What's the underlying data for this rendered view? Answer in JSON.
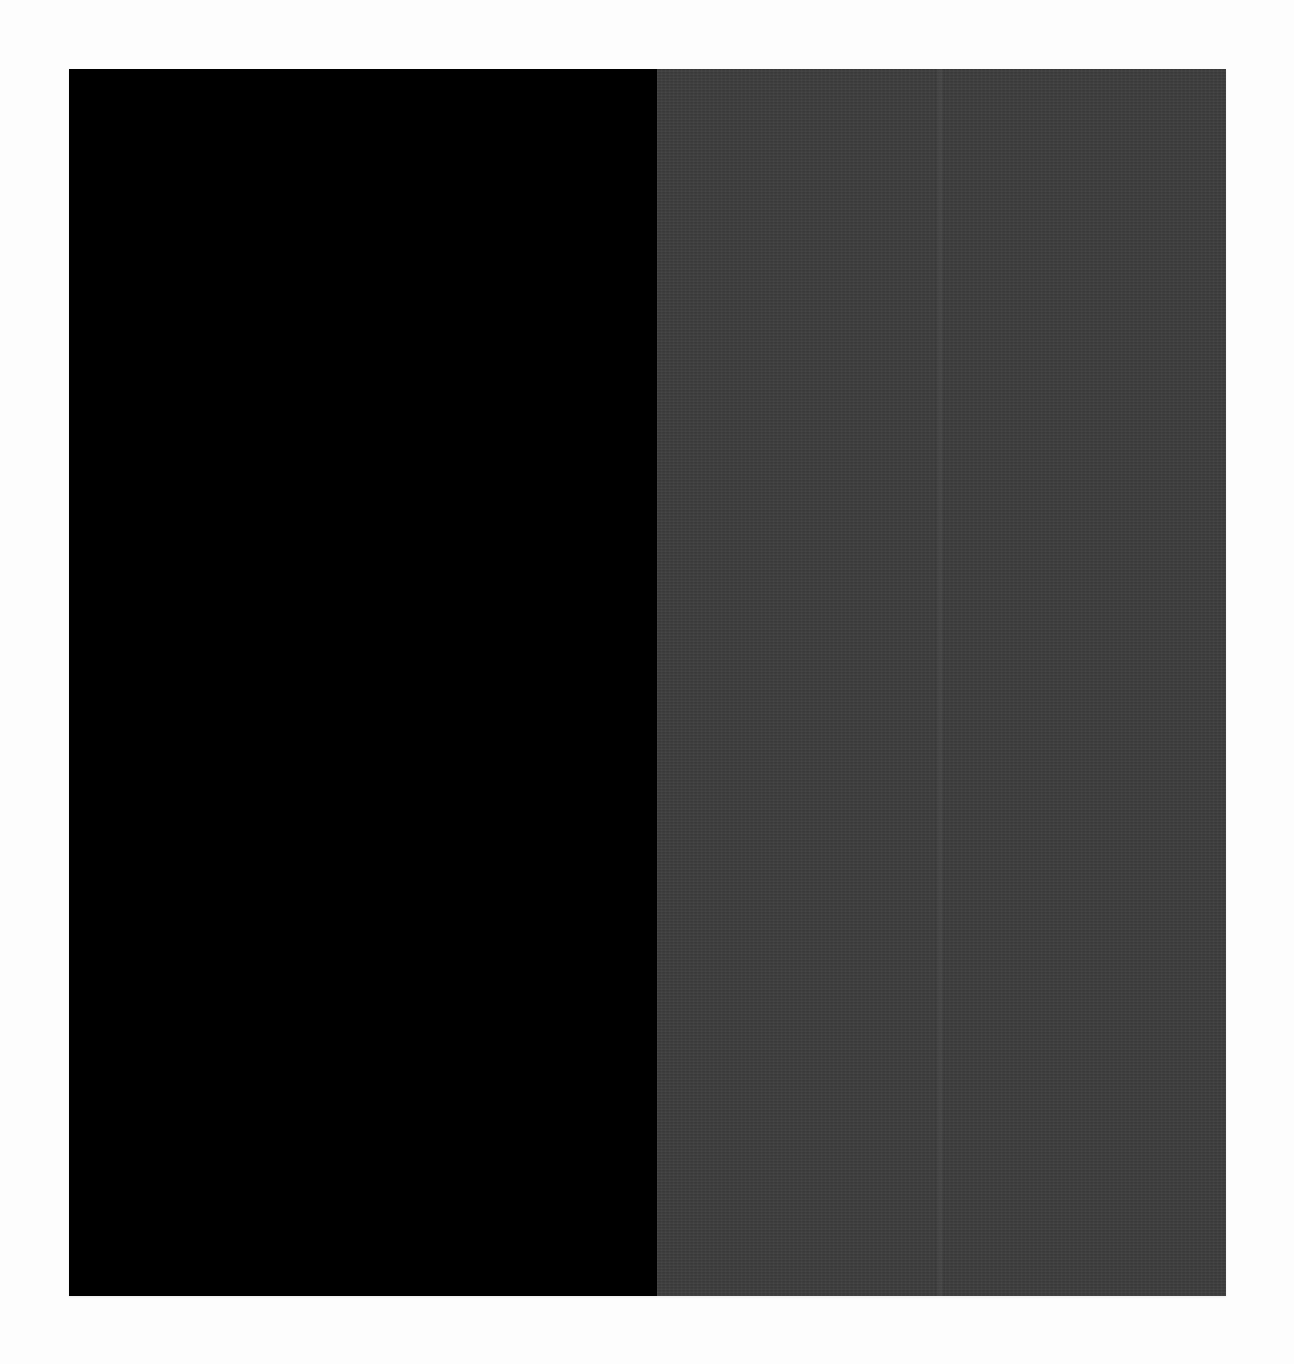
{
  "artwork": {
    "description": "Minimalist two-panel abstract painting: solid black left panel and dark gray linen-textured right panel",
    "colors": {
      "background": "#fdfdfd",
      "left_panel": "#000000",
      "right_panel": "#3b3b3b"
    },
    "panels": [
      {
        "name": "left",
        "color": "#000000"
      },
      {
        "name": "right",
        "color": "#3b3b3b",
        "texture": "linen"
      }
    ],
    "seam_offset_px": 278
  }
}
